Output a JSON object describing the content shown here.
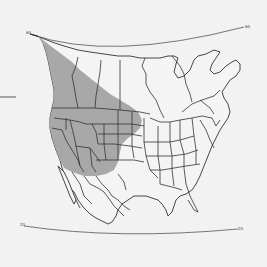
{
  "map": {
    "type": "range-map",
    "region": "North America",
    "graticule": {
      "north_parallel": {
        "label_left": "60",
        "label_right": "60"
      },
      "south_parallel": {
        "label_left": "20",
        "label_right": "20"
      }
    },
    "range_fill_color": "#a8a8a8",
    "background_color": "#f2f2f2",
    "line_color": "#333333",
    "left_tick_mark": true
  }
}
